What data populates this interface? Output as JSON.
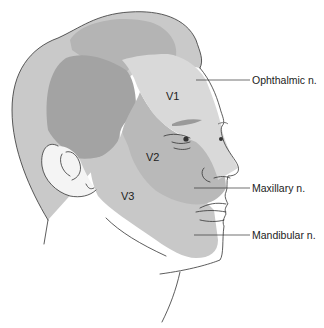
{
  "figure": {
    "colors": {
      "background": "#ffffff",
      "hair_outer": "#c9c9c9",
      "hair_inner": "#b4b4b4",
      "temple_dark": "#a3a3a3",
      "v1_region": "#d9d9d9",
      "v2_region": "#b9b9b9",
      "v3_region": "#c8c8c8",
      "ear": "#f4f4f4",
      "outline": "#333333",
      "text": "#222222"
    }
  },
  "regions": [
    {
      "id": "V1",
      "label": "V1"
    },
    {
      "id": "V2",
      "label": "V2"
    },
    {
      "id": "V3",
      "label": "V3"
    }
  ],
  "callouts": [
    {
      "label": "Ophthalmic n.",
      "region": "V1"
    },
    {
      "label": "Maxillary n.",
      "region": "V2"
    },
    {
      "label": "Mandibular n.",
      "region": "V3"
    }
  ]
}
